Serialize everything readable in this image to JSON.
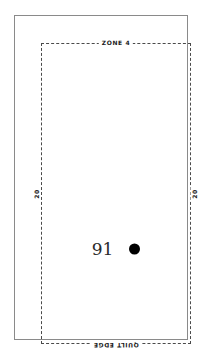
{
  "diagram": {
    "labels": {
      "top": "ZONE 4",
      "bottom": "QUILT EDGE",
      "left": "20",
      "right": "20"
    },
    "marker": {
      "number": "91",
      "dot_icon": "filled-circle-marker",
      "dot_color": "#000000"
    },
    "colors": {
      "outer_frame": "#8a8a8a",
      "dashed_border": "#4a4a4a",
      "background": "#ffffff",
      "text": "#1a1a1a"
    }
  }
}
